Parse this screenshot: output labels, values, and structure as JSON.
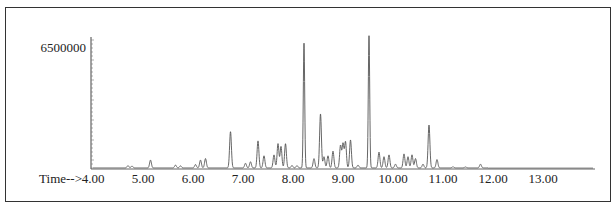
{
  "chart_data": {
    "type": "line",
    "title": "",
    "xlabel": "Time-->",
    "ylabel": "",
    "x_ticks": [
      "4.00",
      "5.00",
      "6.00",
      "7.00",
      "8.00",
      "9.00",
      "10.00",
      "11.00",
      "12.00",
      "13.00"
    ],
    "y_ticks": [
      "6500000"
    ],
    "xlim": [
      4.0,
      14.0
    ],
    "ylim": [
      0,
      7200000
    ],
    "grid": false,
    "legend": null,
    "series": [
      {
        "name": "TIC",
        "peaks": [
          {
            "t": 4.7,
            "h": 120000
          },
          {
            "t": 4.78,
            "h": 100000
          },
          {
            "t": 5.15,
            "h": 420000
          },
          {
            "t": 5.65,
            "h": 150000
          },
          {
            "t": 5.75,
            "h": 110000
          },
          {
            "t": 6.05,
            "h": 180000
          },
          {
            "t": 6.15,
            "h": 420000
          },
          {
            "t": 6.25,
            "h": 500000
          },
          {
            "t": 6.75,
            "h": 1950000
          },
          {
            "t": 7.05,
            "h": 250000
          },
          {
            "t": 7.15,
            "h": 330000
          },
          {
            "t": 7.3,
            "h": 1450000
          },
          {
            "t": 7.42,
            "h": 650000
          },
          {
            "t": 7.62,
            "h": 700000
          },
          {
            "t": 7.7,
            "h": 1300000
          },
          {
            "t": 7.76,
            "h": 1150000
          },
          {
            "t": 7.85,
            "h": 1300000
          },
          {
            "t": 7.98,
            "h": 130000
          },
          {
            "t": 8.08,
            "h": 120000
          },
          {
            "t": 8.22,
            "h": 6700000
          },
          {
            "t": 8.42,
            "h": 500000
          },
          {
            "t": 8.55,
            "h": 2900000
          },
          {
            "t": 8.62,
            "h": 600000
          },
          {
            "t": 8.7,
            "h": 650000
          },
          {
            "t": 8.8,
            "h": 900000
          },
          {
            "t": 8.95,
            "h": 1200000
          },
          {
            "t": 9.0,
            "h": 1300000
          },
          {
            "t": 9.05,
            "h": 1400000
          },
          {
            "t": 9.15,
            "h": 1500000
          },
          {
            "t": 9.3,
            "h": 150000
          },
          {
            "t": 9.52,
            "h": 7100000
          },
          {
            "t": 9.72,
            "h": 850000
          },
          {
            "t": 9.82,
            "h": 600000
          },
          {
            "t": 9.92,
            "h": 700000
          },
          {
            "t": 10.05,
            "h": 200000
          },
          {
            "t": 10.22,
            "h": 750000
          },
          {
            "t": 10.3,
            "h": 600000
          },
          {
            "t": 10.38,
            "h": 700000
          },
          {
            "t": 10.45,
            "h": 500000
          },
          {
            "t": 10.6,
            "h": 200000
          },
          {
            "t": 10.72,
            "h": 2300000
          },
          {
            "t": 10.88,
            "h": 450000
          },
          {
            "t": 11.2,
            "h": 60000
          },
          {
            "t": 11.45,
            "h": 50000
          },
          {
            "t": 11.75,
            "h": 200000
          }
        ],
        "baseline": 60000
      }
    ]
  },
  "axis": {
    "x_label": "Time-->",
    "y_max_label": "6500000"
  }
}
